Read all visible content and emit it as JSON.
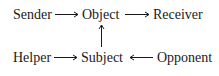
{
  "diagram": {
    "nodes": {
      "sender": "Sender",
      "object": "Object",
      "receiver": "Receiver",
      "helper": "Helper",
      "subject": "Subject",
      "opponent": "Opponent"
    },
    "edges": [
      {
        "from": "Sender",
        "to": "Object"
      },
      {
        "from": "Object",
        "to": "Receiver"
      },
      {
        "from": "Subject",
        "to": "Object"
      },
      {
        "from": "Helper",
        "to": "Subject"
      },
      {
        "from": "Opponent",
        "to": "Subject"
      }
    ],
    "colors": {
      "text": "#1a1a1a",
      "background": "#ffffff"
    }
  }
}
